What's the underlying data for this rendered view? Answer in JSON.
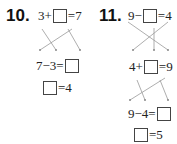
{
  "problem10": {
    "number": "10.",
    "top": {
      "left": "3+",
      "right": "=7"
    },
    "middle": {
      "left": "7−3=",
      "right": ""
    },
    "bottom": {
      "left": "",
      "right": "=4"
    }
  },
  "problem11": {
    "number": "11.",
    "top": {
      "left": "9−",
      "right": "=4"
    },
    "second": {
      "left": "4+",
      "right": "=9"
    },
    "third": {
      "left": "9−4=",
      "right": ""
    },
    "bottom": {
      "left": "",
      "right": "=5"
    }
  }
}
